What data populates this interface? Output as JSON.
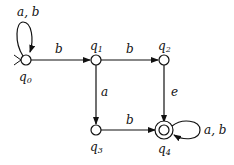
{
  "diagram": {
    "type": "finite-automaton",
    "states": [
      {
        "id": "q0",
        "name": "q",
        "sub": "0",
        "x": 26,
        "y": 60,
        "initial": true,
        "accepting": false
      },
      {
        "id": "q1",
        "name": "q",
        "sub": "1",
        "x": 96,
        "y": 60,
        "initial": false,
        "accepting": false
      },
      {
        "id": "q2",
        "name": "q",
        "sub": "2",
        "x": 164,
        "y": 60,
        "initial": false,
        "accepting": false
      },
      {
        "id": "q3",
        "name": "q",
        "sub": "3",
        "x": 96,
        "y": 130,
        "initial": false,
        "accepting": false
      },
      {
        "id": "q4",
        "name": "q",
        "sub": "4",
        "x": 164,
        "y": 130,
        "initial": false,
        "accepting": true
      }
    ],
    "transitions": [
      {
        "from": "q0",
        "to": "q0",
        "label": "a, b"
      },
      {
        "from": "q0",
        "to": "q1",
        "label": "b"
      },
      {
        "from": "q1",
        "to": "q2",
        "label": "b"
      },
      {
        "from": "q1",
        "to": "q3",
        "label": "a"
      },
      {
        "from": "q2",
        "to": "q4",
        "label": "e"
      },
      {
        "from": "q3",
        "to": "q4",
        "label": "b"
      },
      {
        "from": "q4",
        "to": "q4",
        "label": "a, b"
      }
    ]
  }
}
